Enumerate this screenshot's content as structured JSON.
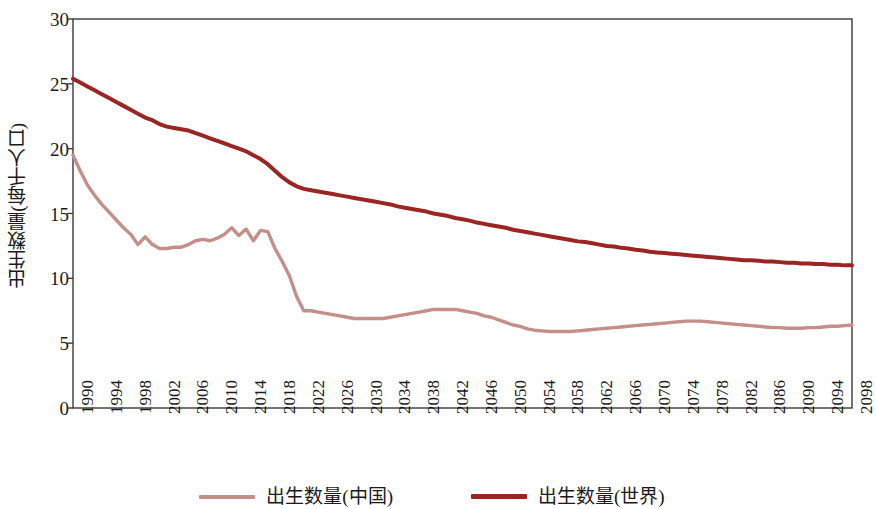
{
  "chart_data": {
    "type": "line",
    "title": "",
    "xlabel": "",
    "ylabel": "出生数量(每千人口)",
    "xlim": [
      1990,
      2098
    ],
    "ylim": [
      0,
      30
    ],
    "ytick_values": [
      0,
      5,
      10,
      15,
      20,
      25,
      30
    ],
    "ytick_labels": [
      "0",
      "5",
      "10",
      "15",
      "20",
      "25",
      "30"
    ],
    "xtick_labels": [
      "1990",
      "1994",
      "1998",
      "2002",
      "2006",
      "2010",
      "2014",
      "2018",
      "2022",
      "2026",
      "2030",
      "2034",
      "2038",
      "2042",
      "2046",
      "2050",
      "2054",
      "2058",
      "2062",
      "2066",
      "2070",
      "2074",
      "2078",
      "2082",
      "2086",
      "2090",
      "2094",
      "2098"
    ],
    "grid": false,
    "legend_position": "bottom",
    "colors": {
      "china": "#c48e89",
      "world": "#9b2523",
      "axis": "#3a3a3a",
      "text": "#1a1a1a"
    },
    "x": [
      1990,
      1991,
      1992,
      1993,
      1994,
      1995,
      1996,
      1997,
      1998,
      1999,
      2000,
      2001,
      2002,
      2003,
      2004,
      2005,
      2006,
      2007,
      2008,
      2009,
      2010,
      2011,
      2012,
      2013,
      2014,
      2015,
      2016,
      2017,
      2018,
      2019,
      2020,
      2021,
      2022,
      2023,
      2024,
      2025,
      2026,
      2027,
      2028,
      2029,
      2030,
      2031,
      2032,
      2033,
      2034,
      2035,
      2036,
      2037,
      2038,
      2039,
      2040,
      2041,
      2042,
      2043,
      2044,
      2045,
      2046,
      2047,
      2048,
      2049,
      2050,
      2051,
      2052,
      2053,
      2054,
      2055,
      2056,
      2057,
      2058,
      2059,
      2060,
      2061,
      2062,
      2063,
      2064,
      2065,
      2066,
      2067,
      2068,
      2069,
      2070,
      2071,
      2072,
      2073,
      2074,
      2075,
      2076,
      2077,
      2078,
      2079,
      2080,
      2081,
      2082,
      2083,
      2084,
      2085,
      2086,
      2087,
      2088,
      2089,
      2090,
      2091,
      2092,
      2093,
      2094,
      2095,
      2096,
      2097,
      2098
    ],
    "series": [
      {
        "name": "出生数量(中国)",
        "color": "#c48e89",
        "values": [
          19.5,
          18.3,
          17.2,
          16.4,
          15.7,
          15.1,
          14.5,
          13.9,
          13.4,
          12.6,
          13.2,
          12.6,
          12.3,
          12.3,
          12.4,
          12.4,
          12.6,
          12.9,
          13.0,
          12.9,
          13.1,
          13.4,
          13.9,
          13.3,
          13.8,
          12.9,
          13.7,
          13.6,
          12.3,
          11.3,
          10.2,
          8.6,
          7.5,
          7.5,
          7.4,
          7.3,
          7.2,
          7.1,
          7.0,
          6.9,
          6.9,
          6.9,
          6.9,
          6.9,
          7.0,
          7.1,
          7.2,
          7.3,
          7.4,
          7.5,
          7.6,
          7.6,
          7.6,
          7.6,
          7.5,
          7.4,
          7.3,
          7.1,
          7.0,
          6.8,
          6.6,
          6.4,
          6.3,
          6.1,
          6.0,
          5.95,
          5.9,
          5.9,
          5.9,
          5.9,
          5.95,
          6.0,
          6.05,
          6.1,
          6.15,
          6.2,
          6.25,
          6.3,
          6.35,
          6.4,
          6.45,
          6.5,
          6.55,
          6.6,
          6.65,
          6.7,
          6.7,
          6.7,
          6.65,
          6.6,
          6.55,
          6.5,
          6.45,
          6.4,
          6.35,
          6.3,
          6.25,
          6.2,
          6.2,
          6.15,
          6.15,
          6.15,
          6.2,
          6.2,
          6.25,
          6.3,
          6.3,
          6.35,
          6.4
        ]
      },
      {
        "name": "出生数量(世界)",
        "color": "#9b2523",
        "values": [
          25.4,
          25.1,
          24.8,
          24.5,
          24.2,
          23.9,
          23.6,
          23.3,
          23.0,
          22.7,
          22.4,
          22.2,
          21.9,
          21.7,
          21.6,
          21.5,
          21.4,
          21.2,
          21.0,
          20.8,
          20.6,
          20.4,
          20.2,
          20.0,
          19.8,
          19.5,
          19.2,
          18.8,
          18.3,
          17.8,
          17.4,
          17.1,
          16.9,
          16.8,
          16.7,
          16.6,
          16.5,
          16.4,
          16.3,
          16.2,
          16.1,
          16.0,
          15.9,
          15.8,
          15.7,
          15.55,
          15.45,
          15.35,
          15.25,
          15.15,
          15.0,
          14.9,
          14.8,
          14.65,
          14.55,
          14.45,
          14.3,
          14.2,
          14.1,
          14.0,
          13.9,
          13.75,
          13.65,
          13.55,
          13.45,
          13.35,
          13.25,
          13.15,
          13.05,
          12.95,
          12.85,
          12.8,
          12.7,
          12.6,
          12.5,
          12.45,
          12.35,
          12.3,
          12.2,
          12.15,
          12.05,
          12.0,
          11.95,
          11.9,
          11.85,
          11.8,
          11.75,
          11.7,
          11.65,
          11.6,
          11.55,
          11.5,
          11.45,
          11.4,
          11.4,
          11.35,
          11.3,
          11.3,
          11.25,
          11.2,
          11.2,
          11.15,
          11.15,
          11.1,
          11.1,
          11.05,
          11.05,
          11.0,
          11.0
        ]
      }
    ]
  },
  "legend": {
    "items": [
      {
        "label": "出生数量(中国)",
        "color": "#c48e89"
      },
      {
        "label": "出生数量(世界)",
        "color": "#9b2523"
      }
    ]
  },
  "axes": {
    "y_axis_title": "出生数量(每千人口)"
  }
}
